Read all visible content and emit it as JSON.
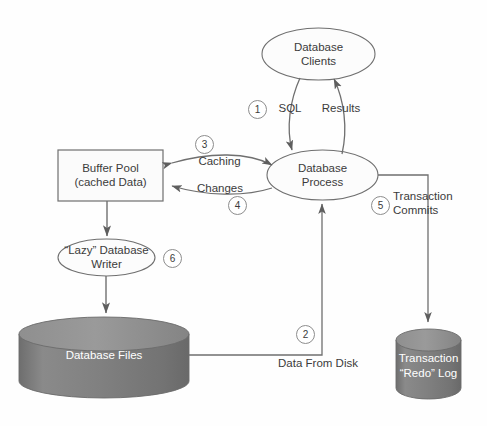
{
  "diagram": {
    "background_color": "#fefefe",
    "stroke_color": "#6f6f6f",
    "text_color": "#3b3b3b",
    "cylinder_fill": "#7c7c7c",
    "cylinder_top_fill": "#8c8c8c",
    "box_fill": "#fbfbfb",
    "ellipse_fill": "#fcfcfc"
  },
  "nodes": {
    "database_clients": {
      "label": "Database\nClients",
      "shape": "ellipse"
    },
    "database_process": {
      "label": "Database\nProcess",
      "shape": "ellipse"
    },
    "buffer_pool": {
      "label": "Buffer Pool\n(cached Data)",
      "shape": "rectangle"
    },
    "lazy_writer": {
      "label": "“Lazy” Database\nWriter",
      "shape": "ellipse"
    },
    "database_files": {
      "label": "Database Files",
      "shape": "cylinder"
    },
    "transaction_log": {
      "label": "Transaction\n“Redo” Log",
      "shape": "cylinder"
    }
  },
  "edges": {
    "sql": {
      "label": "SQL",
      "step": "1"
    },
    "results": {
      "label": "Results",
      "step": ""
    },
    "data_from_disk": {
      "label": "Data From Disk",
      "step": "2"
    },
    "caching": {
      "label": "Caching",
      "step": "3"
    },
    "changes": {
      "label": "Changes",
      "step": "4"
    },
    "transaction_commits": {
      "label": "Transaction\nCommits",
      "step": "5"
    },
    "lazy_write": {
      "label": "",
      "step": "6"
    }
  },
  "steps": {
    "one": "1",
    "two": "2",
    "three": "3",
    "four": "4",
    "five": "5",
    "six": "6"
  }
}
